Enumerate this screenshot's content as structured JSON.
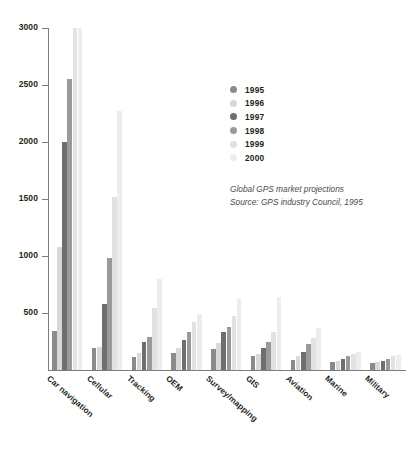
{
  "chart_data": {
    "type": "bar",
    "title": "",
    "xlabel": "",
    "ylabel": "",
    "ylim": [
      0,
      3000
    ],
    "yticks": [
      0,
      500,
      1000,
      1500,
      2000,
      2500,
      3000
    ],
    "ytick_labels": [
      "",
      "500",
      "1000",
      "1500",
      "2000",
      "2500",
      "3000"
    ],
    "grid": false,
    "legend_position": "upper-right-inside",
    "categories": [
      "Car navigation",
      "Cellular",
      "Tracking",
      "OEM",
      "Survey/mapping",
      "GIS",
      "Aviation",
      "Marine",
      "Military"
    ],
    "series": [
      {
        "name": "1995",
        "color": "#8a8a8a",
        "values": [
          340,
          190,
          110,
          150,
          180,
          120,
          90,
          70,
          60
        ]
      },
      {
        "name": "1996",
        "color": "#d8d8d8",
        "values": [
          1080,
          200,
          150,
          190,
          240,
          140,
          120,
          80,
          70
        ]
      },
      {
        "name": "1997",
        "color": "#6e6e6e",
        "values": [
          2000,
          580,
          250,
          260,
          330,
          190,
          160,
          100,
          80
        ]
      },
      {
        "name": "1998",
        "color": "#9a9a9a",
        "values": [
          2550,
          980,
          290,
          330,
          380,
          250,
          230,
          120,
          100
        ]
      },
      {
        "name": "1999",
        "color": "#e2e2e2",
        "values": [
          3000,
          1520,
          540,
          420,
          470,
          330,
          280,
          140,
          120
        ]
      },
      {
        "name": "2000",
        "color": "#ededed",
        "values": [
          3000,
          2270,
          800,
          490,
          620,
          640,
          370,
          160,
          130
        ]
      }
    ],
    "annotations": [
      "Global GPS market projections",
      "Source: GPS industry Council, 1995"
    ]
  },
  "legend": {
    "items": [
      {
        "label": "1995"
      },
      {
        "label": "1996"
      },
      {
        "label": "1997"
      },
      {
        "label": "1998"
      },
      {
        "label": "1999"
      },
      {
        "label": "2000"
      }
    ]
  },
  "caption": {
    "line1": "Global GPS market projections",
    "line2": "Source: GPS industry Council, 1995"
  }
}
